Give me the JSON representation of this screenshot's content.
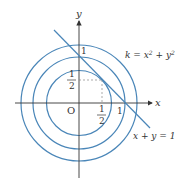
{
  "diagram": {
    "title": "",
    "axes": {
      "x_label": "x",
      "y_label": "y",
      "origin_label": "O",
      "x_tick_labels": [
        "1/2",
        "1"
      ],
      "y_tick_labels": [
        "1/2",
        "1"
      ]
    },
    "curves": {
      "circle_family_label": "k = x² + y²",
      "line_label": "x + y = 1",
      "circles": [
        {
          "name": "inner",
          "radius_units": 0.707
        },
        {
          "name": "middle",
          "radius_units": 1.0
        },
        {
          "name": "outer",
          "radius_units": 1.26
        }
      ],
      "tangent_point": [
        0.5,
        0.5
      ]
    },
    "colors": {
      "curve": "#4a86b8",
      "axis": "#333333",
      "dashed": "#888888"
    },
    "text": {
      "x": "x",
      "y": "y",
      "O": "O",
      "one_x": "1",
      "one_y": "1",
      "half_num": "1",
      "half_den": "2",
      "k_eq": "k = x",
      "plus_y": " + y",
      "sq": "2",
      "line_eq": "x + y = 1"
    }
  }
}
